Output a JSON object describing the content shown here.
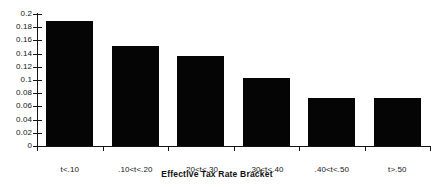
{
  "chart_data": {
    "type": "bar",
    "title": "",
    "xlabel": "Effective Tax Rate Bracket",
    "ylabel": "",
    "categories": [
      "t<.10",
      ".10<t<.20",
      ".20<t<.30",
      ".30<t<.40",
      ".40<t<.50",
      "t>.50"
    ],
    "values": [
      0.19,
      0.152,
      0.136,
      0.103,
      0.073,
      0.072
    ],
    "ylim": [
      0,
      0.2
    ],
    "ytick_values": [
      0,
      0.02,
      0.04,
      0.06,
      0.08,
      0.1,
      0.12,
      0.14,
      0.16,
      0.18,
      0.2
    ],
    "ytick_labels": [
      "0",
      "0.02",
      "0.04",
      "0.06",
      "0.08",
      "0.1",
      "0.12",
      "0.14",
      "0.16",
      "0.18",
      "0.2"
    ],
    "grid": false,
    "legend": false,
    "bar_color": "#050505",
    "axis_color": "#141414",
    "background_color": "#ffffff"
  }
}
